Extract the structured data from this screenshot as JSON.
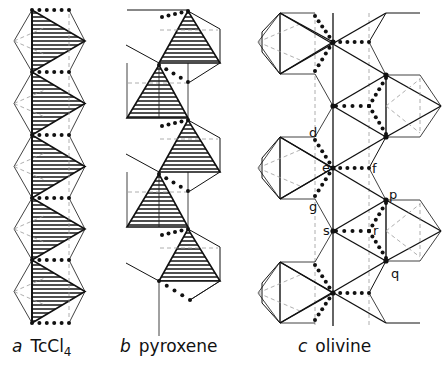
{
  "figure": {
    "panels": [
      {
        "id": "a",
        "letter": "a",
        "name": "TcCl",
        "subscript": "4",
        "caption_x": 12
      },
      {
        "id": "b",
        "letter": "b",
        "name": "pyroxene",
        "subscript": "",
        "caption_x": 120
      },
      {
        "id": "c",
        "letter": "c",
        "name": "olivine",
        "subscript": "",
        "caption_x": 298
      }
    ],
    "olivine_labels": [
      {
        "text": "d",
        "x": 309,
        "y": 137
      },
      {
        "text": "e",
        "x": 322,
        "y": 172
      },
      {
        "text": "f",
        "x": 372,
        "y": 173
      },
      {
        "text": "g",
        "x": 309,
        "y": 211
      },
      {
        "text": "p",
        "x": 389,
        "y": 199
      },
      {
        "text": "s",
        "x": 323,
        "y": 235
      },
      {
        "text": "r",
        "x": 373,
        "y": 235
      },
      {
        "text": "q",
        "x": 391,
        "y": 278
      }
    ],
    "colors": {
      "line": "#111111",
      "hatch": "#222222",
      "dash": "#888888"
    }
  }
}
